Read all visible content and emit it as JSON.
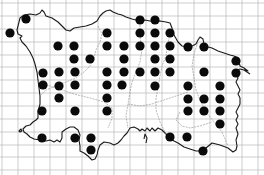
{
  "map": {
    "title": "",
    "width": 264,
    "height": 175,
    "colors": {
      "background": "#ffffff",
      "grid": "#b8b8b8",
      "coastline": "#1a1a1a",
      "parish_boundary": "#8a8a8a",
      "dot": "#0a0a0a"
    },
    "grid": {
      "vertical_x": [
        2,
        18,
        34,
        50,
        66,
        82,
        98,
        114,
        130,
        146,
        162,
        178,
        194,
        210,
        226,
        242,
        258
      ],
      "horizontal_y": [
        3,
        16,
        29,
        42,
        55,
        67,
        80,
        93,
        106,
        119,
        132,
        145,
        157,
        170
      ]
    },
    "dot_radius": 4.6,
    "dots": [
      [
        26,
        19
      ],
      [
        140,
        20
      ],
      [
        155,
        20
      ],
      [
        10,
        33
      ],
      [
        107,
        33
      ],
      [
        140,
        33
      ],
      [
        155,
        33
      ],
      [
        170,
        33
      ],
      [
        58,
        46
      ],
      [
        74,
        46
      ],
      [
        107,
        46
      ],
      [
        124,
        46
      ],
      [
        140,
        46
      ],
      [
        155,
        46
      ],
      [
        170,
        46
      ],
      [
        188,
        47
      ],
      [
        204,
        47
      ],
      [
        74,
        59
      ],
      [
        90,
        59
      ],
      [
        124,
        59
      ],
      [
        155,
        59
      ],
      [
        170,
        59
      ],
      [
        236,
        61
      ],
      [
        43,
        73
      ],
      [
        59,
        72
      ],
      [
        75,
        72
      ],
      [
        107,
        72
      ],
      [
        124,
        72
      ],
      [
        140,
        72
      ],
      [
        155,
        72
      ],
      [
        170,
        72
      ],
      [
        204,
        72
      ],
      [
        236,
        73
      ],
      [
        43,
        85
      ],
      [
        59,
        86
      ],
      [
        75,
        85
      ],
      [
        107,
        85
      ],
      [
        122,
        85
      ],
      [
        155,
        86
      ],
      [
        188,
        86
      ],
      [
        220,
        86
      ],
      [
        59,
        98
      ],
      [
        107,
        98
      ],
      [
        188,
        99
      ],
      [
        204,
        99
      ],
      [
        220,
        99
      ],
      [
        42,
        111
      ],
      [
        75,
        111
      ],
      [
        107,
        111
      ],
      [
        188,
        111
      ],
      [
        204,
        111
      ],
      [
        220,
        111
      ],
      [
        220,
        124
      ],
      [
        42,
        138
      ],
      [
        75,
        138
      ],
      [
        91,
        138
      ],
      [
        170,
        137
      ],
      [
        187,
        137
      ],
      [
        91,
        150
      ],
      [
        203,
        151
      ]
    ]
  }
}
